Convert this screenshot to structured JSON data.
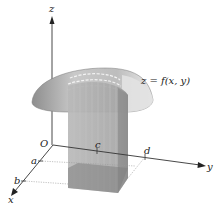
{
  "diagram": {
    "surface_label": "z = f(x, y)",
    "axes": {
      "z": "z",
      "y": "y",
      "x": "x",
      "origin": "O"
    },
    "ticks": {
      "x": [
        "a",
        "b"
      ],
      "y": [
        "c",
        "d"
      ]
    },
    "colors": {
      "axis": "#333333",
      "surface_light": "#e6e6e6",
      "surface_dark": "#9a9a9a",
      "column": "#b0b0b0",
      "column_dark": "#8c8c8c",
      "base": "#7d7d7d"
    }
  }
}
